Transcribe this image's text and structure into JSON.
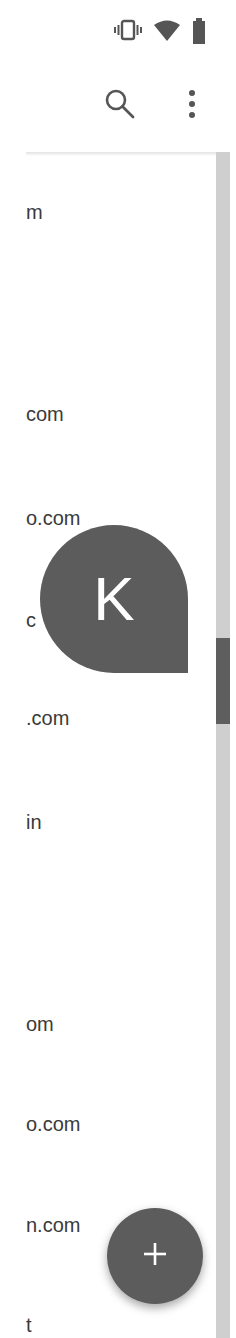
{
  "status_bar": {
    "icons": [
      "vibrate-icon",
      "wifi-icon",
      "battery-icon"
    ]
  },
  "toolbar": {
    "actions": [
      {
        "name": "search-button",
        "icon": "search-icon"
      },
      {
        "name": "more-options-button",
        "icon": "more-vert-icon"
      }
    ]
  },
  "list": {
    "rows": [
      {
        "text": "m",
        "top": 44
      },
      {
        "text": "",
        "top": 146
      },
      {
        "text": "com",
        "top": 246
      },
      {
        "text": "o.com",
        "top": 350
      },
      {
        "text": "c",
        "top": 452
      },
      {
        "text": ".com",
        "top": 550
      },
      {
        "text": "in",
        "top": 654
      },
      {
        "text": "",
        "top": 756
      },
      {
        "text": "om",
        "top": 856
      },
      {
        "text": "o.com",
        "top": 956
      },
      {
        "text": "n.com",
        "top": 1057
      },
      {
        "text": "t",
        "top": 1157
      }
    ]
  },
  "fast_scroll": {
    "letter": "K"
  },
  "fab": {
    "icon": "plus-icon"
  },
  "colors": {
    "accent": "#5c5c5c",
    "text": "#3a3a3a",
    "scroll_track": "#cfcfcf",
    "scroll_thumb": "#5e5e5e"
  }
}
